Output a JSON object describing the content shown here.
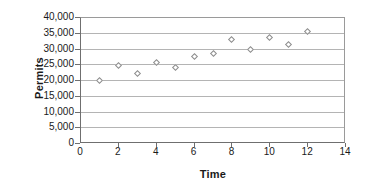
{
  "chart_data": {
    "type": "scatter",
    "title": "",
    "xlabel": "Time",
    "ylabel": "Permits",
    "xlim": [
      0,
      14
    ],
    "ylim": [
      0,
      40000
    ],
    "grid": true,
    "legend": "none",
    "marker": "open-diamond",
    "x": [
      1,
      2,
      3,
      4,
      5,
      6,
      7,
      8,
      9,
      10,
      11,
      12
    ],
    "values": [
      20000,
      24800,
      22100,
      25800,
      24000,
      27700,
      28500,
      33000,
      29700,
      33600,
      31500,
      35500
    ],
    "series": [
      {
        "name": "Permits",
        "points": [
          {
            "x": 1,
            "y": 20000
          },
          {
            "x": 2,
            "y": 24800
          },
          {
            "x": 3,
            "y": 22100
          },
          {
            "x": 4,
            "y": 25800
          },
          {
            "x": 5,
            "y": 24000
          },
          {
            "x": 6,
            "y": 27700
          },
          {
            "x": 7,
            "y": 28500
          },
          {
            "x": 8,
            "y": 33000
          },
          {
            "x": 9,
            "y": 29700
          },
          {
            "x": 10,
            "y": 33600
          },
          {
            "x": 11,
            "y": 31500
          },
          {
            "x": 12,
            "y": 35500
          }
        ]
      }
    ],
    "y_tick_labels": [
      "40,000",
      "35,000",
      "30,000",
      "25,000",
      "20,000",
      "15,000",
      "10,000",
      "5,000",
      "0"
    ],
    "y_tick_values": [
      40000,
      35000,
      30000,
      25000,
      20000,
      15000,
      10000,
      5000,
      0
    ],
    "x_tick_labels": [
      "0",
      "2",
      "4",
      "6",
      "8",
      "10",
      "12",
      "14"
    ],
    "x_tick_values": [
      0,
      2,
      4,
      6,
      8,
      10,
      12,
      14
    ],
    "colors": {
      "marker_stroke": "#8d8d8d",
      "marker_fill": "#ffffff",
      "gridline": "#b4b4b4",
      "axis": "#6f6f6f",
      "text": "#1a1a1a",
      "background": "#ffffff"
    }
  }
}
